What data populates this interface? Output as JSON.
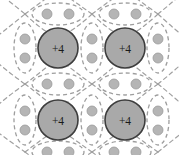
{
  "figure": {
    "width": 179,
    "height": 155,
    "background_color": "#ffffff"
  },
  "style": {
    "core_fill": "#a9a9a9",
    "core_stroke": "#3d3d3d",
    "core_radius": 20,
    "core_stroke_width": 1.6,
    "electron_fill": "#b5b5b5",
    "electron_stroke": "#9a9a9a",
    "electron_radius": 5,
    "orbital_stroke": "#9e9e9e",
    "orbital_stroke_width": 1.3,
    "orbital_dash": "4 3",
    "bond_arc_stroke": "#a0a0a0",
    "bond_arc_stroke_width": 1.2,
    "bond_arc_dash": "4 3.5",
    "label_color": "#1a1a1a"
  },
  "atom_cores": [
    {
      "id": "core-top-left",
      "label": "+4",
      "cx": 58,
      "cy": 48
    },
    {
      "id": "core-top-right",
      "label": "+4",
      "cx": 125,
      "cy": 48
    },
    {
      "id": "core-bottom-left",
      "label": "+4",
      "cx": 58,
      "cy": 120
    },
    {
      "id": "core-bottom-right",
      "label": "+4",
      "cx": 125,
      "cy": 120
    }
  ],
  "lattice": {
    "node_columns": [
      25,
      92,
      158
    ],
    "node_rows": [
      14,
      84,
      152
    ],
    "core_columns": [
      58,
      125
    ],
    "core_rows": [
      48,
      120
    ]
  },
  "bond_pairs": [
    {
      "id": "pair-top-left",
      "orientation": "horizontal",
      "cx": 58,
      "cy": 14,
      "rx": 26,
      "ry": 11,
      "electrons": 2
    },
    {
      "id": "pair-top-right",
      "orientation": "horizontal",
      "cx": 125,
      "cy": 14,
      "rx": 26,
      "ry": 11,
      "electrons": 2
    },
    {
      "id": "pair-mid-left",
      "orientation": "horizontal",
      "cx": 58,
      "cy": 84,
      "rx": 26,
      "ry": 11,
      "electrons": 2
    },
    {
      "id": "pair-mid-right",
      "orientation": "horizontal",
      "cx": 125,
      "cy": 84,
      "rx": 26,
      "ry": 11,
      "electrons": 2
    },
    {
      "id": "pair-bottom-left",
      "orientation": "horizontal",
      "cx": 58,
      "cy": 152,
      "rx": 26,
      "ry": 11,
      "electrons": 2
    },
    {
      "id": "pair-bottom-right",
      "orientation": "horizontal",
      "cx": 125,
      "cy": 152,
      "rx": 26,
      "ry": 11,
      "electrons": 2
    },
    {
      "id": "pair-left-upper",
      "orientation": "vertical",
      "cx": 25,
      "cy": 48,
      "rx": 11,
      "ry": 25,
      "electrons": 2
    },
    {
      "id": "pair-center-upper",
      "orientation": "vertical",
      "cx": 92,
      "cy": 48,
      "rx": 11,
      "ry": 25,
      "electrons": 2
    },
    {
      "id": "pair-right-upper",
      "orientation": "vertical",
      "cx": 158,
      "cy": 48,
      "rx": 11,
      "ry": 25,
      "electrons": 2
    },
    {
      "id": "pair-left-lower",
      "orientation": "vertical",
      "cx": 25,
      "cy": 120,
      "rx": 11,
      "ry": 25,
      "electrons": 2
    },
    {
      "id": "pair-center-lower",
      "orientation": "vertical",
      "cx": 92,
      "cy": 120,
      "rx": 11,
      "ry": 25,
      "electrons": 2
    },
    {
      "id": "pair-right-lower",
      "orientation": "vertical",
      "cx": 158,
      "cy": 120,
      "rx": 11,
      "ry": 25,
      "electrons": 2
    }
  ],
  "electron_dots": [
    {
      "cx": 47,
      "cy": 14
    },
    {
      "cx": 69,
      "cy": 14
    },
    {
      "cx": 114,
      "cy": 14
    },
    {
      "cx": 136,
      "cy": 14
    },
    {
      "cx": 47,
      "cy": 84
    },
    {
      "cx": 69,
      "cy": 84
    },
    {
      "cx": 114,
      "cy": 84
    },
    {
      "cx": 136,
      "cy": 84
    },
    {
      "cx": 47,
      "cy": 152
    },
    {
      "cx": 69,
      "cy": 152
    },
    {
      "cx": 114,
      "cy": 152
    },
    {
      "cx": 136,
      "cy": 152
    },
    {
      "cx": 25,
      "cy": 39
    },
    {
      "cx": 25,
      "cy": 58
    },
    {
      "cx": 92,
      "cy": 39
    },
    {
      "cx": 92,
      "cy": 58
    },
    {
      "cx": 158,
      "cy": 39
    },
    {
      "cx": 158,
      "cy": 58
    },
    {
      "cx": 25,
      "cy": 111
    },
    {
      "cx": 25,
      "cy": 130
    },
    {
      "cx": 92,
      "cy": 111
    },
    {
      "cx": 92,
      "cy": 130
    },
    {
      "cx": 158,
      "cy": 111
    },
    {
      "cx": 158,
      "cy": 130
    }
  ]
}
